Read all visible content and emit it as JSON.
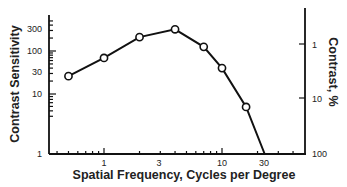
{
  "chart_data": {
    "type": "line",
    "title": "",
    "xlabel": "Spatial Frequency, Cycles per Degree",
    "ylabel": "Contrast Sensitivity",
    "ylabel_right": "Contrast, %",
    "x_scale": "log",
    "y_scale": "log",
    "x_ticks": [
      "1",
      "3",
      "10",
      "30"
    ],
    "y_ticks": [
      "1",
      "10",
      "30",
      "100",
      "300"
    ],
    "y_right_ticks": [
      "1",
      "10",
      "100"
    ],
    "grid": false,
    "legend": null,
    "series": [
      {
        "name": "Contrast sensitivity",
        "marker": "open-circle",
        "x": [
          0.5,
          1,
          2,
          4,
          7,
          10,
          16
        ],
        "y": [
          26,
          69,
          210,
          320,
          125,
          40,
          5
        ]
      }
    ],
    "extrapolated_line": {
      "from": [
        16,
        5
      ],
      "to": [
        23,
        1
      ]
    },
    "xlim": [
      0.4,
      45
    ],
    "ylim": [
      1,
      500
    ]
  }
}
